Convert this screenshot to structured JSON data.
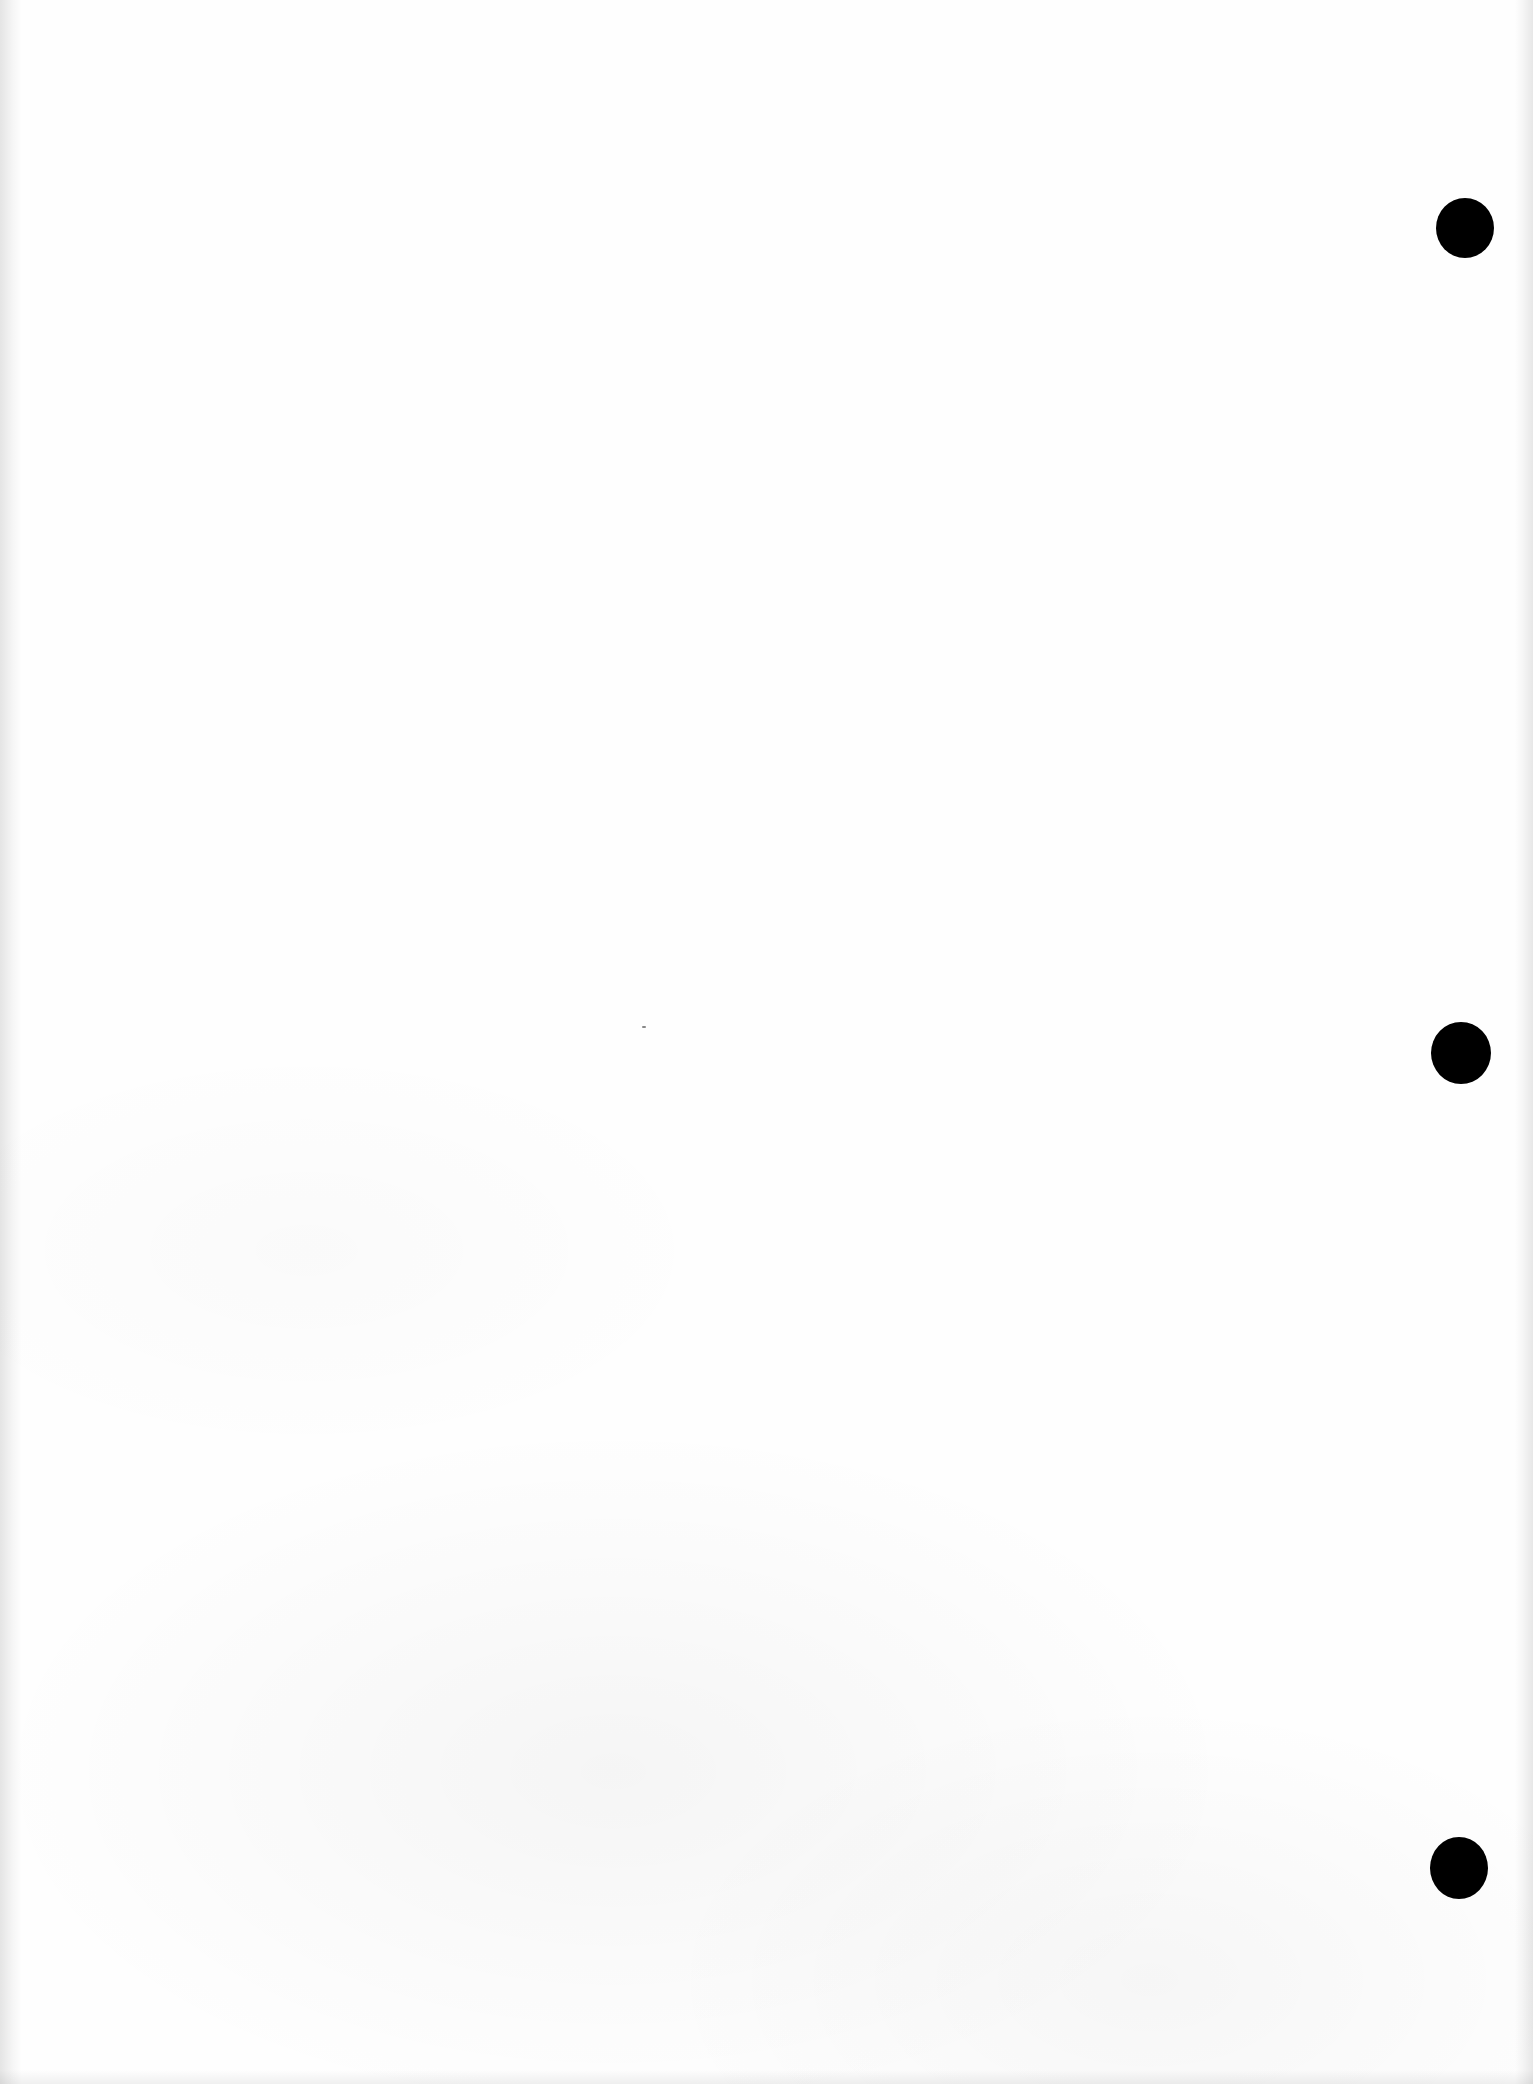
{
  "document": {
    "type": "scanned blank page",
    "background_color": "#fefefe",
    "hole_color": "#000000",
    "punch_holes": [
      {
        "cx": 1465,
        "cy": 228,
        "rx": 29,
        "ry": 30
      },
      {
        "cx": 1461,
        "cy": 1053,
        "rx": 30,
        "ry": 31
      },
      {
        "cx": 1459,
        "cy": 1868,
        "rx": 29,
        "ry": 31
      }
    ],
    "specks": [
      {
        "x": 642,
        "y": 1026
      }
    ],
    "text_content": []
  }
}
